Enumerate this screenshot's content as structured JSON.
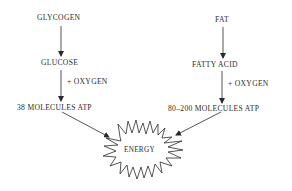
{
  "diagram": {
    "left_chain": {
      "source": "GLYCOGEN",
      "intermediate": "GLUCOSE",
      "reagent": "+ OXYGEN",
      "product": "38 MOLECULES ATP"
    },
    "right_chain": {
      "source": "FAT",
      "intermediate": "FATTY ACID",
      "reagent": "+ OXYGEN",
      "product": "80–200 MOLECULES ATP"
    },
    "result": "ENERGY",
    "colors": {
      "ink": "#2a2a2a",
      "background": "#ffffff"
    }
  }
}
